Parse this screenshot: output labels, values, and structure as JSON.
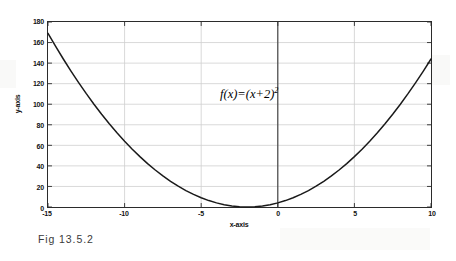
{
  "caption": "Fig 13.5.2",
  "colors": {
    "background": "#ffffff",
    "axis": "#2b2b2b",
    "grid": "#cfcfcf",
    "curve": "#1a1a1a",
    "zero_line": "#3a3a3a",
    "text": "#111111",
    "caption_text": "#3a3a3a"
  },
  "chart_data": {
    "type": "line",
    "title": "",
    "subtitle": "",
    "xlabel": "x-axis",
    "ylabel": "y-axis",
    "annotation": "f(x)=(x+2)",
    "annotation_exponent": "2",
    "annotation_full": "f(x)=(x+2)^2",
    "function": "f(x) = (x + 2)^2",
    "xlim": [
      -15,
      10
    ],
    "ylim": [
      0,
      180
    ],
    "xticks": [
      -15,
      -10,
      -5,
      0,
      5,
      10
    ],
    "xtick_labels": [
      "-15",
      "-10",
      "-5",
      "0",
      "5",
      "10"
    ],
    "yticks": [
      0,
      20,
      40,
      60,
      80,
      100,
      120,
      140,
      160,
      180
    ],
    "ytick_labels": [
      "0",
      "20",
      "40",
      "60",
      "80",
      "100",
      "120",
      "140",
      "160",
      "180"
    ],
    "grid": true,
    "grid_axes": "both",
    "legend": null,
    "legend_position": "none",
    "vertex": [
      -2,
      0
    ],
    "series": [
      {
        "name": "f(x)=(x+2)^2",
        "x": [
          -15,
          -14.5,
          -14,
          -13.5,
          -13,
          -12.5,
          -12,
          -11.5,
          -11,
          -10.5,
          -10,
          -9.5,
          -9,
          -8.5,
          -8,
          -7.5,
          -7,
          -6.5,
          -6,
          -5.5,
          -5,
          -4.5,
          -4,
          -3.5,
          -3,
          -2.5,
          -2,
          -1.5,
          -1,
          -0.5,
          0,
          0.5,
          1,
          1.5,
          2,
          2.5,
          3,
          3.5,
          4,
          4.5,
          5,
          5.5,
          6,
          6.5,
          7,
          7.5,
          8,
          8.5,
          9,
          9.5,
          10
        ],
        "y": [
          169,
          156.25,
          144,
          132.25,
          121,
          110.25,
          100,
          90.25,
          81,
          72.25,
          64,
          56.25,
          49,
          42.25,
          36,
          30.25,
          25,
          20.25,
          16,
          12.25,
          9,
          6.25,
          4,
          2.25,
          1,
          0.25,
          0,
          0.25,
          1,
          2.25,
          4,
          6.25,
          9,
          12.25,
          16,
          20.25,
          25,
          30.25,
          36,
          42.25,
          49,
          56.25,
          64,
          72.25,
          81,
          90.25,
          100,
          110.25,
          121,
          132.25,
          144
        ]
      }
    ],
    "reference_lines": [
      {
        "name": "x-zero-line",
        "orientation": "vertical",
        "value": 0
      }
    ]
  }
}
